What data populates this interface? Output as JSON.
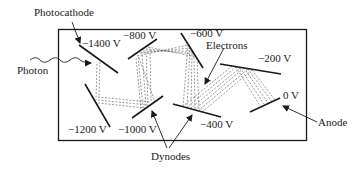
{
  "labels": {
    "photocathode": "Photocathode",
    "photon": "Photon",
    "electrons": "Electrons",
    "dynodes": "Dynodes",
    "anode": "Anode"
  },
  "voltages": {
    "cathode": "−1400 V",
    "d1": "−1200 V",
    "d2": "−1000 V",
    "d3": "−800 V",
    "d4": "−600 V",
    "d5": "−400 V",
    "d6": "−200 V",
    "anode": "0 V"
  },
  "colors": {
    "line": "#1a1a1a",
    "dashed": "#555555",
    "background": "#ffffff"
  }
}
